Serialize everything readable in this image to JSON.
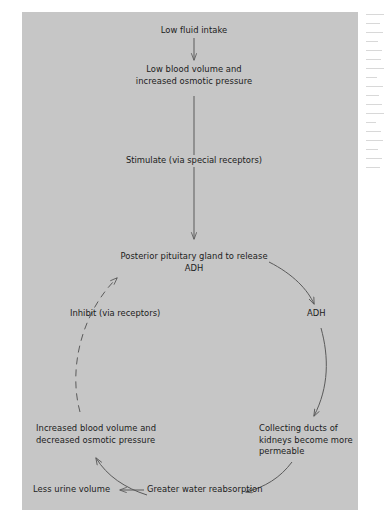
{
  "figure": {
    "type": "flowchart",
    "background_color": "#c6c6c6",
    "text_color": "#1b1b1b",
    "line_color": "#5a5a5a"
  },
  "nodes": [
    {
      "id": "low-fluid-intake",
      "label": "Low fluid intake",
      "x": 194,
      "y": 22,
      "align": "center"
    },
    {
      "id": "low-blood-volume",
      "label": "Low blood volume and\nincreased osmotic pressure",
      "x": 194,
      "y": 66,
      "align": "center"
    },
    {
      "id": "posterior-pituitary",
      "label": "Posterior pituitary gland to release ADH",
      "x": 194,
      "y": 251,
      "align": "center"
    },
    {
      "id": "collecting-ducts",
      "label": "Collecting ducts of\nkidneys become more\npermeable",
      "x": 259,
      "y": 425,
      "align": "left"
    },
    {
      "id": "increased-blood-volume",
      "label": "Increased blood volume and\ndecreased osmotic pressure",
      "x": 36,
      "y": 425,
      "align": "left"
    },
    {
      "id": "greater-water-reabsorption",
      "label": "Greater water reabsorption",
      "x": 147,
      "y": 489,
      "align": "left"
    },
    {
      "id": "less-urine-volume",
      "label": "Less urine volume",
      "x": 33,
      "y": 489,
      "align": "left"
    }
  ],
  "edge_labels": [
    {
      "id": "stimulate",
      "label": "Stimulate (via special receptors)",
      "x": 194,
      "y": 155
    },
    {
      "id": "adh",
      "label": "ADH",
      "x": 297,
      "y": 311
    },
    {
      "id": "inhibit",
      "label": "Inhibit (via receptors)",
      "x": 92,
      "y": 311
    }
  ],
  "edges": [
    {
      "id": "intake-to-blood-volume",
      "from": "low-fluid-intake",
      "to": "low-blood-volume",
      "style": "solid",
      "shape": "straight-down"
    },
    {
      "id": "blood-volume-to-pituitary",
      "from": "low-blood-volume",
      "to": "posterior-pituitary",
      "style": "solid",
      "shape": "straight-down",
      "label": "Stimulate (via special receptors)"
    },
    {
      "id": "pituitary-to-collecting-ducts",
      "from": "posterior-pituitary",
      "to": "collecting-ducts",
      "style": "solid",
      "shape": "arc-right",
      "label": "ADH"
    },
    {
      "id": "collecting-ducts-to-reabsorption",
      "from": "collecting-ducts",
      "to": "greater-water-reabsorption",
      "style": "solid",
      "shape": "arc"
    },
    {
      "id": "reabsorption-to-urine",
      "from": "greater-water-reabsorption",
      "to": "less-urine-volume",
      "style": "solid",
      "shape": "straight-left"
    },
    {
      "id": "reabsorption-to-increased-blood-volume",
      "from": "greater-water-reabsorption",
      "to": "increased-blood-volume",
      "style": "solid",
      "shape": "arc"
    },
    {
      "id": "increased-blood-volume-to-pituitary",
      "from": "increased-blood-volume",
      "to": "posterior-pituitary",
      "style": "dashed",
      "shape": "arc-left",
      "label": "Inhibit (via receptors)"
    }
  ]
}
